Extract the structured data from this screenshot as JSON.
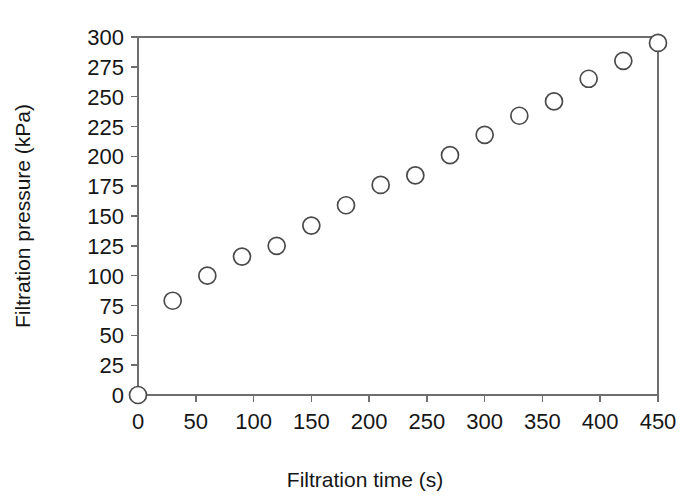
{
  "chart_data": {
    "type": "scatter",
    "title": "",
    "xlabel": "Filtration time  (s)",
    "ylabel": "Filtration pressure (kPa)",
    "xlim": [
      0,
      450
    ],
    "ylim": [
      0,
      300
    ],
    "xticks": [
      0,
      50,
      100,
      150,
      200,
      250,
      300,
      350,
      400,
      450
    ],
    "yticks": [
      0,
      25,
      50,
      75,
      100,
      125,
      150,
      175,
      200,
      225,
      250,
      275,
      300
    ],
    "xtick_labels": [
      "0",
      "50",
      "100",
      "150",
      "200",
      "250",
      "300",
      "350",
      "400",
      "450"
    ],
    "ytick_labels": [
      "0",
      "25",
      "50",
      "75",
      "100",
      "125",
      "150",
      "175",
      "200",
      "225",
      "250",
      "275",
      "300"
    ],
    "grid": false,
    "legend": null,
    "marker": "open-circle",
    "marker_face_color": "#ffffff",
    "marker_edge_color": "#4a4a4a",
    "x": [
      0,
      30,
      60,
      90,
      120,
      150,
      180,
      210,
      240,
      270,
      300,
      330,
      360,
      390,
      420,
      450
    ],
    "y": [
      0,
      79,
      100,
      116,
      125,
      142,
      159,
      176,
      184,
      201,
      218,
      234,
      246,
      265,
      280,
      295
    ],
    "series": [
      {
        "name": "Filtration pressure",
        "points": [
          {
            "x": 0,
            "y": 0
          },
          {
            "x": 30,
            "y": 79
          },
          {
            "x": 60,
            "y": 100
          },
          {
            "x": 90,
            "y": 116
          },
          {
            "x": 120,
            "y": 125
          },
          {
            "x": 150,
            "y": 142
          },
          {
            "x": 180,
            "y": 159
          },
          {
            "x": 210,
            "y": 176
          },
          {
            "x": 240,
            "y": 184
          },
          {
            "x": 270,
            "y": 201
          },
          {
            "x": 300,
            "y": 218
          },
          {
            "x": 330,
            "y": 234
          },
          {
            "x": 360,
            "y": 246
          },
          {
            "x": 390,
            "y": 265
          },
          {
            "x": 420,
            "y": 280
          },
          {
            "x": 450,
            "y": 295
          }
        ]
      }
    ]
  },
  "style": {
    "background": "#ffffff",
    "axis_color": "#6e6e6e",
    "text_color": "#161616"
  },
  "geometry": {
    "plot_left": 138,
    "plot_right": 658,
    "plot_top": 37,
    "plot_bottom": 395,
    "marker_radius": 8.5,
    "tick_length": 7
  }
}
